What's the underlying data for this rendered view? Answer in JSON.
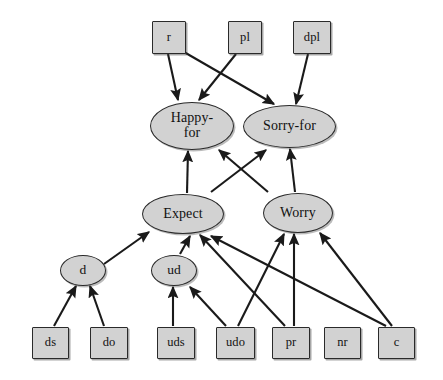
{
  "diagram": {
    "type": "directed-graph",
    "canvas": {
      "width": 443,
      "height": 380
    },
    "style": {
      "node_fill": "#d2d2d2",
      "node_stroke": "#2a2a2a",
      "edge_color": "#1a1a1a",
      "background": "#ffffff"
    },
    "nodes": [
      {
        "id": "r",
        "label": "r",
        "shape": "box",
        "x": 152,
        "y": 21,
        "w": 34,
        "h": 33
      },
      {
        "id": "pl",
        "label": "pl",
        "shape": "box",
        "x": 228,
        "y": 21,
        "w": 34,
        "h": 33
      },
      {
        "id": "dpl",
        "label": "dpl",
        "shape": "box",
        "x": 293,
        "y": 21,
        "w": 38,
        "h": 33
      },
      {
        "id": "happy-for",
        "label": "Happy-\nfor",
        "shape": "ellipse",
        "x": 150,
        "y": 102,
        "w": 84,
        "h": 48,
        "size": "big"
      },
      {
        "id": "sorry-for",
        "label": "Sorry-for",
        "shape": "ellipse",
        "x": 243,
        "y": 105,
        "w": 93,
        "h": 43,
        "size": "big"
      },
      {
        "id": "expect",
        "label": "Expect",
        "shape": "ellipse",
        "x": 142,
        "y": 194,
        "w": 82,
        "h": 40,
        "size": "big"
      },
      {
        "id": "worry",
        "label": "Worry",
        "shape": "ellipse",
        "x": 263,
        "y": 193,
        "w": 70,
        "h": 40,
        "size": "big"
      },
      {
        "id": "d",
        "label": "d",
        "shape": "ellipse",
        "x": 60,
        "y": 255,
        "w": 46,
        "h": 31,
        "size": "small"
      },
      {
        "id": "ud",
        "label": "ud",
        "shape": "ellipse",
        "x": 151,
        "y": 255,
        "w": 46,
        "h": 31,
        "size": "small"
      },
      {
        "id": "ds",
        "label": "ds",
        "shape": "box",
        "x": 32,
        "y": 327,
        "w": 37,
        "h": 32
      },
      {
        "id": "do",
        "label": "do",
        "shape": "box",
        "x": 90,
        "y": 327,
        "w": 38,
        "h": 32
      },
      {
        "id": "uds",
        "label": "uds",
        "shape": "box",
        "x": 157,
        "y": 327,
        "w": 38,
        "h": 32
      },
      {
        "id": "udo",
        "label": "udo",
        "shape": "box",
        "x": 216,
        "y": 327,
        "w": 39,
        "h": 32
      },
      {
        "id": "pr",
        "label": "pr",
        "shape": "box",
        "x": 272,
        "y": 327,
        "w": 38,
        "h": 32
      },
      {
        "id": "nr",
        "label": "nr",
        "shape": "box",
        "x": 324,
        "y": 327,
        "w": 37,
        "h": 32
      },
      {
        "id": "c",
        "label": "c",
        "shape": "box",
        "x": 378,
        "y": 327,
        "w": 37,
        "h": 32
      }
    ],
    "edges": [
      {
        "from": "r",
        "to": "happy-for",
        "x1": 168,
        "y1": 54,
        "x2": 178,
        "y2": 100
      },
      {
        "from": "r",
        "to": "sorry-for",
        "x1": 184,
        "y1": 52,
        "x2": 274,
        "y2": 104
      },
      {
        "from": "pl",
        "to": "happy-for",
        "x1": 236,
        "y1": 54,
        "x2": 199,
        "y2": 100
      },
      {
        "from": "dpl",
        "to": "sorry-for",
        "x1": 308,
        "y1": 54,
        "x2": 296,
        "y2": 104
      },
      {
        "from": "expect",
        "to": "happy-for",
        "x1": 187,
        "y1": 193,
        "x2": 188,
        "y2": 151
      },
      {
        "from": "expect",
        "to": "sorry-for",
        "x1": 211,
        "y1": 192,
        "x2": 266,
        "y2": 150
      },
      {
        "from": "worry",
        "to": "happy-for",
        "x1": 268,
        "y1": 192,
        "x2": 219,
        "y2": 150
      },
      {
        "from": "worry",
        "to": "sorry-for",
        "x1": 295,
        "y1": 192,
        "x2": 290,
        "y2": 149
      },
      {
        "from": "d",
        "to": "expect",
        "x1": 104,
        "y1": 264,
        "x2": 149,
        "y2": 232
      },
      {
        "from": "ud",
        "to": "expect",
        "x1": 180,
        "y1": 254,
        "x2": 190,
        "y2": 236
      },
      {
        "from": "ds",
        "to": "d",
        "x1": 54,
        "y1": 326,
        "x2": 76,
        "y2": 286
      },
      {
        "from": "do",
        "to": "d",
        "x1": 104,
        "y1": 326,
        "x2": 90,
        "y2": 286
      },
      {
        "from": "uds",
        "to": "ud",
        "x1": 173,
        "y1": 326,
        "x2": 173,
        "y2": 287
      },
      {
        "from": "udo",
        "to": "ud",
        "x1": 226,
        "y1": 326,
        "x2": 190,
        "y2": 287
      },
      {
        "from": "udo",
        "to": "worry",
        "x1": 238,
        "y1": 326,
        "x2": 284,
        "y2": 234
      },
      {
        "from": "pr",
        "to": "expect",
        "x1": 285,
        "y1": 326,
        "x2": 200,
        "y2": 235
      },
      {
        "from": "pr",
        "to": "worry",
        "x1": 294,
        "y1": 326,
        "x2": 294,
        "y2": 234
      },
      {
        "from": "c",
        "to": "expect",
        "x1": 386,
        "y1": 326,
        "x2": 211,
        "y2": 236
      },
      {
        "from": "c",
        "to": "worry",
        "x1": 392,
        "y1": 326,
        "x2": 320,
        "y2": 233
      }
    ]
  }
}
